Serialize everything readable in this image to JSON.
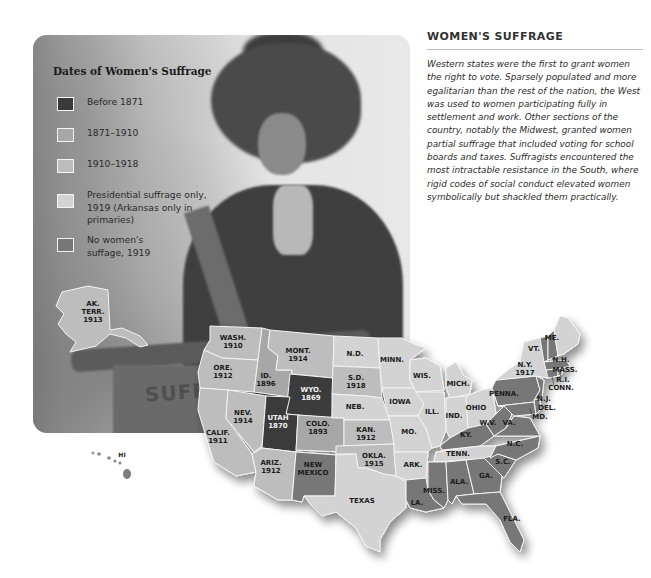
{
  "legend": {
    "title": "Dates of Women's Suffrage",
    "items": [
      {
        "key": "before_1871",
        "label": "Before 1871",
        "color": "#3a3a3a"
      },
      {
        "key": "1871_1910",
        "label": "1871–1910",
        "color": "#a7a7a7"
      },
      {
        "key": "1910_1918",
        "label": "1910–1918",
        "color": "#bdbdbd"
      },
      {
        "key": "presidential_1919",
        "label": "Presidential suffrage only, 1919 (Arkansas only in primaries)",
        "color": "#d3d3d3"
      },
      {
        "key": "none_1919",
        "label": "No women's suffage, 1919",
        "color": "#777777"
      }
    ]
  },
  "sidebar": {
    "heading": "WOMEN'S SUFFRAGE",
    "body": "Western states were the first to grant women the right to vote. Sparsely populated and more egalitarian than the rest of the nation, the West was used to women participating fully in settlement and work. Other sections of the country, notably the Midwest, granted women partial suffrage that included voting for school boards and taxes. Suffragists encountered the most intractable resistance in the South, where rigid codes of social conduct elevated women symbolically but shackled them practically."
  },
  "photo": {
    "banner_text": "SUFFR"
  },
  "map": {
    "states": {
      "wa": {
        "name": "WASH.",
        "year": "1910"
      },
      "or": {
        "name": "ORE.",
        "year": "1912"
      },
      "ca": {
        "name": "CALIF.",
        "year": "1911"
      },
      "id": {
        "name": "ID.",
        "year": "1896"
      },
      "nv": {
        "name": "NEV.",
        "year": "1914"
      },
      "mt": {
        "name": "MONT.",
        "year": "1914"
      },
      "wy": {
        "name": "WYO.",
        "year": "1869"
      },
      "ut": {
        "name": "UTAH",
        "year": "1870"
      },
      "co": {
        "name": "COLO.",
        "year": "1893"
      },
      "az": {
        "name": "ARIZ.",
        "year": "1912"
      },
      "nm": {
        "name": "NEW",
        "name2": "MEXICO"
      },
      "nd": {
        "name": "N.D."
      },
      "sd": {
        "name": "S.D.",
        "year": "1918"
      },
      "ne": {
        "name": "NEB."
      },
      "ks": {
        "name": "KAN.",
        "year": "1912"
      },
      "ok": {
        "name": "OKLA.",
        "year": "1915"
      },
      "tx": {
        "name": "TEXAS"
      },
      "mn": {
        "name": "MINN."
      },
      "ia": {
        "name": "IOWA"
      },
      "mo": {
        "name": "MO."
      },
      "ar": {
        "name": "ARK."
      },
      "la": {
        "name": "LA."
      },
      "wi": {
        "name": "WIS."
      },
      "il": {
        "name": "ILL."
      },
      "mi": {
        "name": "MICH."
      },
      "in": {
        "name": "IND."
      },
      "oh": {
        "name": "OHIO"
      },
      "ky": {
        "name": "KY."
      },
      "tn": {
        "name": "TENN."
      },
      "ms": {
        "name": "MISS."
      },
      "al": {
        "name": "ALA."
      },
      "ga": {
        "name": "GA."
      },
      "fl": {
        "name": "FLA."
      },
      "sc": {
        "name": "S.C."
      },
      "nc": {
        "name": "N.C."
      },
      "va": {
        "name": "VA."
      },
      "wv": {
        "name": "W.V."
      },
      "pa": {
        "name": "PENNA."
      },
      "ny": {
        "name": "N.Y.",
        "year": "1917"
      },
      "vt": {
        "name": "VT."
      },
      "nh": {
        "name": "N.H."
      },
      "me": {
        "name": "ME."
      },
      "ma": {
        "name": "MASS."
      },
      "ri": {
        "name": "R.I."
      },
      "ct": {
        "name": "CONN."
      },
      "nj": {
        "name": "N.J."
      },
      "de": {
        "name": "DEL."
      },
      "md": {
        "name": "MD."
      },
      "ak": {
        "name": "AK.",
        "name2": "TERR.",
        "year": "1913"
      },
      "hi": {
        "name": "HI"
      }
    }
  }
}
